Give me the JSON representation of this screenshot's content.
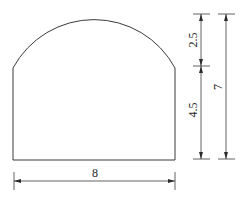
{
  "diagram": {
    "type": "cross-section",
    "shape": {
      "base_width": "8",
      "wall_height": "4.5",
      "arch_rise": "2.5",
      "total_height": "7"
    },
    "dimensions": {
      "width_label": "8",
      "arch_rise_label": "2.5",
      "wall_height_label": "4.5",
      "total_height_label": "7"
    },
    "colors": {
      "line": "#3a3a3a",
      "text": "#2a2a2a",
      "background": "#ffffff"
    }
  }
}
